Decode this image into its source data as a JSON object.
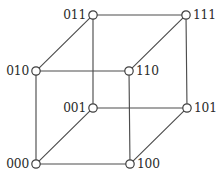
{
  "figure": {
    "background_color": "#ffffff",
    "edge_color": "#4d4d4d",
    "vertex_fill_color": "#ffffff",
    "vertex_stroke_color": "#3f3f3f",
    "label_color": "#2b2b2b"
  },
  "chart_data": {
    "type": "diagram",
    "title": "",
    "xlabel": "",
    "ylabel": "",
    "nodes": [
      {
        "id": "011",
        "label": "011",
        "x": 93,
        "y": 15,
        "label_side": "left",
        "label_x": 86,
        "label_y": 19
      },
      {
        "id": "111",
        "label": "111",
        "x": 186,
        "y": 15,
        "label_side": "right",
        "label_x": 193,
        "label_y": 19
      },
      {
        "id": "010",
        "label": "010",
        "x": 36,
        "y": 71,
        "label_side": "left",
        "label_x": 29,
        "label_y": 75
      },
      {
        "id": "110",
        "label": "110",
        "x": 129,
        "y": 71,
        "label_side": "right",
        "label_x": 136,
        "label_y": 75
      },
      {
        "id": "001",
        "label": "001",
        "x": 93,
        "y": 108,
        "label_side": "left",
        "label_x": 86,
        "label_y": 112
      },
      {
        "id": "101",
        "label": "101",
        "x": 187,
        "y": 108,
        "label_side": "right",
        "label_x": 194,
        "label_y": 112
      },
      {
        "id": "000",
        "label": "000",
        "x": 36,
        "y": 164,
        "label_side": "left",
        "label_x": 29,
        "label_y": 168
      },
      {
        "id": "100",
        "label": "100",
        "x": 130,
        "y": 164,
        "label_side": "right",
        "label_x": 137,
        "label_y": 168
      }
    ],
    "edges": [
      {
        "from": "011",
        "to": "111",
        "kind": "back-top"
      },
      {
        "from": "011",
        "to": "001",
        "kind": "back-vertical-left"
      },
      {
        "from": "111",
        "to": "101",
        "kind": "back-vertical-right"
      },
      {
        "from": "001",
        "to": "101",
        "kind": "back-bottom"
      },
      {
        "from": "010",
        "to": "110",
        "kind": "front-top"
      },
      {
        "from": "010",
        "to": "000",
        "kind": "front-vertical-left"
      },
      {
        "from": "110",
        "to": "100",
        "kind": "front-vertical-right"
      },
      {
        "from": "000",
        "to": "100",
        "kind": "front-bottom"
      },
      {
        "from": "010",
        "to": "011",
        "kind": "depth-diagonal"
      },
      {
        "from": "110",
        "to": "111",
        "kind": "depth-diagonal"
      },
      {
        "from": "000",
        "to": "001",
        "kind": "depth-diagonal"
      },
      {
        "from": "100",
        "to": "101",
        "kind": "depth-diagonal"
      }
    ],
    "node_radius": 4.2,
    "node_count": 8,
    "edge_count": 12
  }
}
